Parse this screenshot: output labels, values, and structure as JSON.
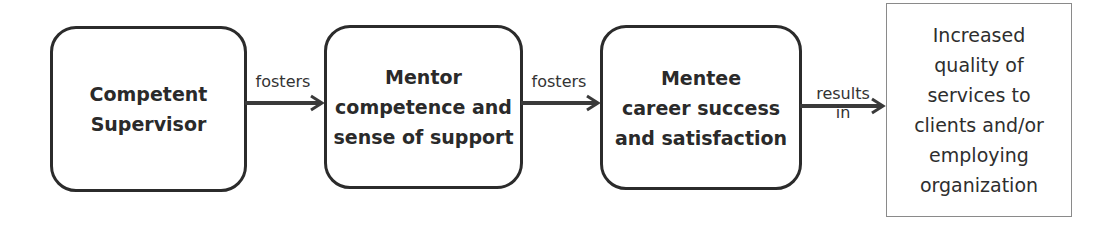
{
  "diagram": {
    "type": "flowchart",
    "direction": "left-to-right",
    "nodes": [
      {
        "id": "n1",
        "label": "Competent\nSupervisor",
        "shape": "rounded-rectangle",
        "bold": true
      },
      {
        "id": "n2",
        "label": "Mentor\ncompetence and\nsense of support",
        "shape": "rounded-rectangle",
        "bold": true
      },
      {
        "id": "n3",
        "label": "Mentee\ncareer success\nand satisfaction",
        "shape": "rounded-rectangle",
        "bold": true
      },
      {
        "id": "n4",
        "label": "Increased\nquality of\nservices to\nclients and/or\nemploying\norganization",
        "shape": "rectangle",
        "bold": false
      }
    ],
    "edges": [
      {
        "from": "n1",
        "to": "n2",
        "label": "fosters"
      },
      {
        "from": "n2",
        "to": "n3",
        "label": "fosters"
      },
      {
        "from": "n3",
        "to": "n4",
        "label": "results\nin"
      }
    ]
  },
  "colors": {
    "box_border": "#2b2b2b",
    "outcome_border": "#8a8a8a",
    "arrow": "#3a3a3a",
    "text": "#2a2a2a",
    "background": "#ffffff"
  }
}
